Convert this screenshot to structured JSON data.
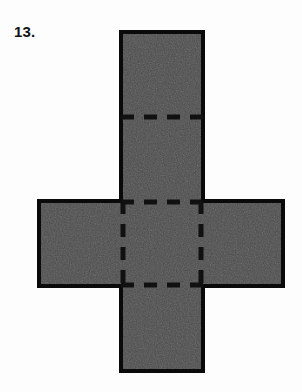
{
  "page": {
    "background_color": "#fdfdfd",
    "width": 302,
    "height": 392
  },
  "problem": {
    "number_label": "13.",
    "label_color": "#111111"
  },
  "figure": {
    "name": "cube-net-cross-shape",
    "fill_color": "#4d4d4d",
    "stroke_color": "#0a0a0a",
    "stroke_width": 4,
    "dash_color": "#111111",
    "dash_width": 5,
    "dash_pattern": "13 10",
    "vertical_bar": {
      "x": 121,
      "y": 32,
      "width": 82,
      "height": 339
    },
    "horizontal_bar": {
      "x": 39,
      "y": 201,
      "width": 244,
      "height": 85
    },
    "fold_lines": [
      {
        "name": "fold-top-horizontal",
        "orientation": "horizontal",
        "x1": 121,
        "y1": 117,
        "x2": 203,
        "y2": 117
      },
      {
        "name": "fold-middle-upper-horizontal",
        "orientation": "horizontal",
        "x1": 121,
        "y1": 202,
        "x2": 203,
        "y2": 202
      },
      {
        "name": "fold-middle-lower-horizontal",
        "orientation": "horizontal",
        "x1": 121,
        "y1": 285,
        "x2": 203,
        "y2": 285
      },
      {
        "name": "fold-left-vertical",
        "orientation": "vertical",
        "x1": 123,
        "y1": 201,
        "x2": 123,
        "y2": 286
      },
      {
        "name": "fold-right-vertical",
        "orientation": "vertical",
        "x1": 201,
        "y1": 201,
        "x2": 201,
        "y2": 286
      }
    ],
    "faces_count": 6
  }
}
